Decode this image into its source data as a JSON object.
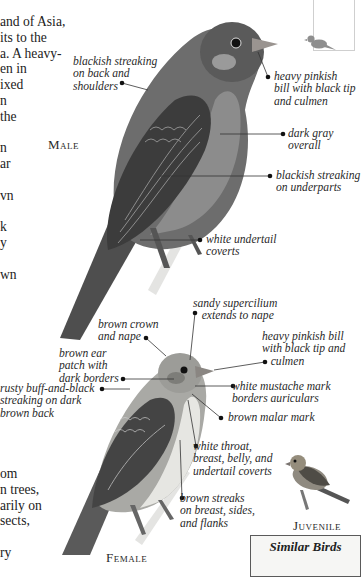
{
  "body_text": {
    "upper_lines": [
      "and of Asia,",
      "its to the",
      "a. A heavy-",
      "en in",
      "ixed",
      "n",
      "the",
      "",
      "n",
      "ar",
      "",
      "vn",
      "",
      "k",
      "y",
      "",
      "wn"
    ],
    "lower_lines": [
      "om",
      "n trees,",
      "arily on",
      "sects,",
      "",
      "ry"
    ]
  },
  "captions": {
    "male": "Male",
    "female": "Female",
    "juvenile": "Juvenile"
  },
  "male_labels": {
    "back": "blackish streaking\non back and\nshoulders",
    "bill": "heavy pinkish\nbill with black tip\nand culmen",
    "overall": "dark gray\noverall",
    "underparts": "blackish streaking\non underparts",
    "undertail": "white undertail\ncoverts"
  },
  "female_labels": {
    "supercilium": "sandy supercilium\n   extends to nape",
    "crown": "brown crown\nand nape",
    "ear": "brown ear\npatch with\ndark borders",
    "back": "rusty buff-and-black\nstreaking on dark\nbrown back",
    "bill": "heavy pinkish bill\nwith black tip and\n   culmen",
    "mustache": "white mustache mark\nborders auriculars",
    "malar": "brown malar mark",
    "throat": "white throat,\nbreast, belly, and\nundertail coverts",
    "streaks": "brown streaks\non breast, sides,\nand flanks"
  },
  "similar_birds": {
    "title": "Similar Birds"
  },
  "colors": {
    "text": "#222222",
    "label": "#2a2a2a",
    "leader_line": "#333333",
    "map_border": "#cfcfcf",
    "box_border": "#5a5a5a",
    "box_bg": "#f6f6f4"
  }
}
